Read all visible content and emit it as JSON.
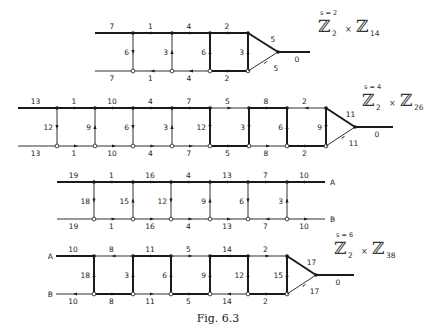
{
  "figure": {
    "caption": "Fig. 6.3",
    "diagrams": [
      {
        "id": "d1",
        "top_y": 33,
        "bot_y": 71,
        "xs": [
          95,
          133,
          172,
          210,
          248
        ],
        "top_labels": [
          "7",
          "1",
          "4",
          "2"
        ],
        "bot_labels": [
          "7",
          "1",
          "4",
          "2"
        ],
        "top_thick": [
          true,
          true,
          true,
          true
        ],
        "bot_thick": [
          false,
          false,
          false,
          true
        ],
        "top_arrows": [
          null,
          "right",
          "right",
          "right"
        ],
        "bot_arrows": [
          null,
          "left",
          "left",
          "right"
        ],
        "verts": [
          {
            "label": "6",
            "thick": false,
            "dir": "down"
          },
          {
            "label": "3",
            "thick": false,
            "dir": "up"
          },
          {
            "label": "6",
            "thick": true,
            "dir": "up"
          },
          {
            "label": "3",
            "thick": true,
            "dir": "up"
          }
        ],
        "triangle": {
          "apex_x": 278,
          "out_x": 310,
          "top_label": "5",
          "bot_label": "5",
          "out_label": "0"
        },
        "group": {
          "s": "s = 2",
          "a": "2",
          "b": "14",
          "x": 318,
          "y": 22
        },
        "ends": null
      },
      {
        "id": "d2",
        "top_y": 108,
        "bot_y": 146,
        "xs": [
          18,
          57,
          95,
          133,
          172,
          210,
          249,
          287,
          326
        ],
        "top_labels": [
          "13",
          "1",
          "10",
          "4",
          "7",
          "5",
          "8",
          "2"
        ],
        "bot_labels": [
          "13",
          "1",
          "10",
          "4",
          "7",
          "5",
          "8",
          "2"
        ],
        "top_thick": [
          true,
          true,
          true,
          true,
          true,
          false,
          true,
          false
        ],
        "bot_thick": [
          false,
          false,
          false,
          false,
          false,
          true,
          false,
          true
        ],
        "top_arrows": [
          null,
          "right",
          "right",
          "right",
          "right",
          "right",
          "right",
          "left"
        ],
        "bot_arrows": [
          null,
          "right",
          "right",
          "right",
          "right",
          "right",
          "right",
          "right"
        ],
        "verts": [
          {
            "label": "12",
            "thick": false,
            "dir": "down"
          },
          {
            "label": "9",
            "thick": false,
            "dir": "up"
          },
          {
            "label": "6",
            "thick": false,
            "dir": "down"
          },
          {
            "label": "3",
            "thick": false,
            "dir": "up"
          },
          {
            "label": "12",
            "thick": true,
            "dir": "down"
          },
          {
            "label": "3",
            "thick": true,
            "dir": "down"
          },
          {
            "label": "6",
            "thick": true,
            "dir": "up"
          },
          {
            "label": "9",
            "thick": true,
            "dir": "down"
          }
        ],
        "triangle": {
          "apex_x": 355,
          "out_x": 393,
          "top_label": "11",
          "bot_label": "11",
          "out_label": "0"
        },
        "group": {
          "s": "s = 4",
          "a": "2",
          "b": "26",
          "x": 362,
          "y": 96
        },
        "ends": null
      },
      {
        "id": "d3",
        "top_y": 182,
        "bot_y": 219,
        "xs": [
          57,
          94,
          133,
          171,
          210,
          248,
          287,
          325
        ],
        "top_labels": [
          "19",
          "1",
          "16",
          "4",
          "13",
          "7",
          "10"
        ],
        "bot_labels": [
          "19",
          "1",
          "16",
          "4",
          "13",
          "7",
          "10"
        ],
        "top_thick": [
          true,
          true,
          true,
          true,
          true,
          true,
          true
        ],
        "bot_thick": [
          false,
          false,
          false,
          false,
          false,
          false,
          false
        ],
        "top_arrows": [
          null,
          "right",
          "right",
          "right",
          "right",
          "right",
          "right"
        ],
        "bot_arrows": [
          null,
          "right",
          "right",
          "right",
          "right",
          "left",
          "right"
        ],
        "verts": [
          {
            "label": "18",
            "thick": false,
            "dir": "down"
          },
          {
            "label": "15",
            "thick": false,
            "dir": "up"
          },
          {
            "label": "12",
            "thick": false,
            "dir": "down"
          },
          {
            "label": "9",
            "thick": false,
            "dir": "up"
          },
          {
            "label": "6",
            "thick": false,
            "dir": "down"
          },
          {
            "label": "3",
            "thick": false,
            "dir": "up"
          }
        ],
        "triangle": null,
        "group": null,
        "ends": {
          "top": "A",
          "bottom": "B",
          "side": "right"
        }
      },
      {
        "id": "d4",
        "top_y": 256,
        "bot_y": 294,
        "xs": [
          56,
          94,
          133,
          171,
          210,
          248,
          287
        ],
        "top_labels": [
          "10",
          "8",
          "11",
          "5",
          "14",
          "2"
        ],
        "bot_labels": [
          "10",
          "8",
          "11",
          "5",
          "14",
          "2"
        ],
        "top_thick": [
          true,
          false,
          true,
          false,
          true,
          false
        ],
        "bot_thick": [
          false,
          true,
          false,
          true,
          false,
          true
        ],
        "top_arrows": [
          null,
          "left",
          "right",
          "right",
          "left",
          "right"
        ],
        "bot_arrows": [
          "left",
          "right",
          "right",
          "right",
          "left",
          "right"
        ],
        "verts": [
          {
            "label": "18",
            "thick": true,
            "dir": "up"
          },
          {
            "label": "3",
            "thick": true,
            "dir": "up"
          },
          {
            "label": "6",
            "thick": true,
            "dir": "up"
          },
          {
            "label": "9",
            "thick": true,
            "dir": "up"
          },
          {
            "label": "12",
            "thick": true,
            "dir": "up"
          },
          {
            "label": "15",
            "thick": true,
            "dir": "up"
          }
        ],
        "triangle": {
          "apex_x": 316,
          "out_x": 354,
          "top_label": "17",
          "bot_label": "17",
          "out_label": "0"
        },
        "group": {
          "s": "s = 6",
          "a": "2",
          "b": "38",
          "x": 334,
          "y": 244
        },
        "ends": {
          "top": "A",
          "bottom": "B",
          "side": "left"
        }
      }
    ]
  },
  "style": {
    "ink": "#1a1a1a",
    "thin": 0.9,
    "thick": 2.0
  }
}
